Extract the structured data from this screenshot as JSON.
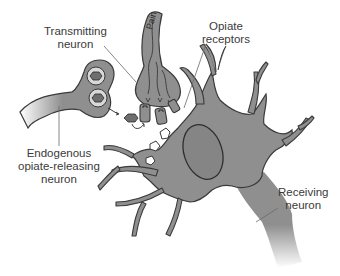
{
  "diagram": {
    "title": "",
    "colors": {
      "neuron_fill": "#8f8f8f",
      "neuron_stroke": "#3a3a3a",
      "nucleus_fill": "#858585",
      "vesicle_fill": "#6e6e6e",
      "background": "#ffffff",
      "label_text": "#3a3a3a",
      "leader_line": "#6a6a6a"
    },
    "labels": {
      "transmitting": {
        "line1": "Transmitting",
        "line2": "neuron"
      },
      "opiate_receptors": {
        "line1": "Opiate",
        "line2": "receptors"
      },
      "endogenous": {
        "line1": "Endogenous",
        "line2": "opiate-releasing",
        "line3": "neuron"
      },
      "receiving": {
        "line1": "Receiving",
        "line2": "neuron"
      }
    },
    "axon_text": "Pain",
    "nodes": [
      {
        "id": "transmitting-neuron",
        "label": "Transmitting neuron"
      },
      {
        "id": "endogenous-opiate-releasing-neuron",
        "label": "Endogenous opiate-releasing neuron"
      },
      {
        "id": "opiate-receptors",
        "label": "Opiate receptors"
      },
      {
        "id": "receiving-neuron",
        "label": "Receiving neuron"
      }
    ],
    "edges": [
      {
        "from": "endogenous-opiate-releasing-neuron",
        "to": "opiate-receptors",
        "label": "released opiate molecules"
      },
      {
        "from": "transmitting-neuron",
        "to": "receiving-neuron",
        "label": "Pain signal"
      }
    ]
  }
}
